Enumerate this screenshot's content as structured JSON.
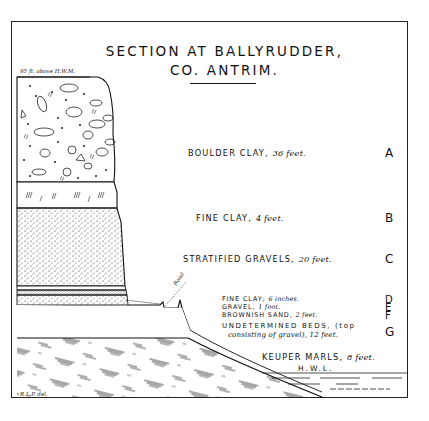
{
  "title": {
    "line1": "SECTION AT BALLYRUDDER,",
    "line2": "CO. ANTRIM."
  },
  "elevation_note": "95 ft. above H.W.M.",
  "road_label": "Road",
  "credit": "R.L.P. del.",
  "hwl_label": "H.W.L.",
  "layers": [
    {
      "key": "A",
      "name": "BOULDER CLAY,",
      "thickness": "36 feet."
    },
    {
      "key": "B",
      "name": "FINE CLAY,",
      "thickness": "4 feet."
    },
    {
      "key": "C",
      "name": "STRATIFIED GRAVELS,",
      "thickness": "20 feet."
    },
    {
      "key": "D",
      "name": "FINE CLAY;",
      "thickness": "6 inches."
    },
    {
      "key": "E",
      "name": "GRAVEL,",
      "thickness": "1 foot."
    },
    {
      "key": "F",
      "name": "BROWNISH SAND,",
      "thickness": "2 feet."
    },
    {
      "key": "G",
      "name": "UNDETERMINED BEDS, (top",
      "name2": "consisting of gravel), 12 feet."
    },
    {
      "key": "",
      "name": "KEUPER MARLS,",
      "thickness": "8 feet."
    }
  ],
  "colors": {
    "ink": "#1a1a1a",
    "paper": "#ffffff"
  }
}
